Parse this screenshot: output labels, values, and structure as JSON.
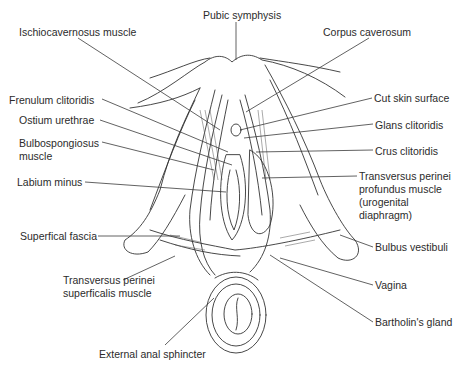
{
  "figure": {
    "labels": [
      {
        "id": "pubic-symphysis",
        "text": "Pubic symphysis",
        "x": 203,
        "y": 9
      },
      {
        "id": "ischiocavernosus",
        "text": "Ischiocavernosus muscle",
        "x": 19,
        "y": 26
      },
      {
        "id": "corpus-cavernosum",
        "text": "Corpus caverosum",
        "x": 323,
        "y": 26
      },
      {
        "id": "frenulum",
        "text": "Frenulum clitoridis",
        "x": 9,
        "y": 94
      },
      {
        "id": "cut-skin",
        "text": "Cut skin surface",
        "x": 374,
        "y": 92
      },
      {
        "id": "ostium",
        "text": "Ostium urethrae",
        "x": 19,
        "y": 114
      },
      {
        "id": "glans",
        "text": "Glans clitoridis",
        "x": 375,
        "y": 119
      },
      {
        "id": "bulbospongiosus",
        "text": "Bulbospongiosus muscle",
        "x": 19,
        "y": 137,
        "multiline": true
      },
      {
        "id": "crus",
        "text": "Crus clitoridis",
        "x": 375,
        "y": 145
      },
      {
        "id": "labium-minus",
        "text": "Labium minus",
        "x": 17,
        "y": 176
      },
      {
        "id": "transversus-profundus",
        "text": "Transversus perinei profundus muscle (urogenital diaphragm)",
        "x": 359,
        "y": 170,
        "multiline": true
      },
      {
        "id": "superficial-fascia",
        "text": "Superfical fascia",
        "x": 20,
        "y": 230
      },
      {
        "id": "bulbus-vestibuli",
        "text": "Bulbus vestibuli",
        "x": 375,
        "y": 241
      },
      {
        "id": "transversus-superficialis",
        "text": "Transversus perinei superficalis muscle",
        "x": 63,
        "y": 274,
        "multiline": true
      },
      {
        "id": "vagina",
        "text": "Vagina",
        "x": 375,
        "y": 279
      },
      {
        "id": "bartholin",
        "text": "Bartholin's gland",
        "x": 375,
        "y": 316
      },
      {
        "id": "external-anal-sphincter",
        "text": "External anal sphincter",
        "x": 99,
        "y": 348
      }
    ],
    "line_color": "#3a3a3a",
    "background": "#ffffff"
  }
}
